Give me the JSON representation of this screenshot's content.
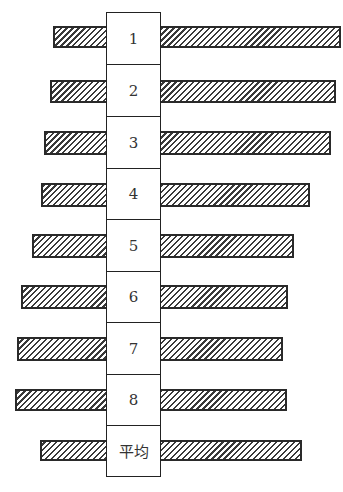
{
  "diagram": {
    "column_labels": [
      "1",
      "2",
      "3",
      "4",
      "5",
      "6",
      "7",
      "8",
      "平均"
    ],
    "bars": [
      {
        "label": "1",
        "left": 53,
        "right": 341,
        "top": 26,
        "bottom": 48
      },
      {
        "label": "2",
        "left": 50,
        "right": 336,
        "top": 80,
        "bottom": 103
      },
      {
        "label": "3",
        "left": 44,
        "right": 331,
        "top": 131,
        "bottom": 155
      },
      {
        "label": "4",
        "left": 41,
        "right": 310,
        "top": 183,
        "bottom": 207
      },
      {
        "label": "5",
        "left": 32,
        "right": 294,
        "top": 234,
        "bottom": 258
      },
      {
        "label": "6",
        "left": 21,
        "right": 288,
        "top": 285,
        "bottom": 309
      },
      {
        "label": "7",
        "left": 17,
        "right": 283,
        "top": 337,
        "bottom": 361
      },
      {
        "label": "8",
        "left": 15,
        "right": 287,
        "top": 389,
        "bottom": 411
      },
      {
        "label": "平均",
        "left": 40,
        "right": 302,
        "top": 440,
        "bottom": 461
      }
    ],
    "row_boundaries": [
      12,
      64,
      116,
      168,
      219,
      271,
      322,
      374,
      425,
      477
    ],
    "colors": {
      "hatch": "#3a3a3a",
      "border": "#2a2a2a",
      "background": "#ffffff"
    }
  }
}
